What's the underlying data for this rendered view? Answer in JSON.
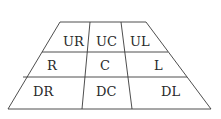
{
  "diagram": {
    "rows": [
      {
        "cells": [
          {
            "label": "UR"
          },
          {
            "label": "UC"
          },
          {
            "label": "UL"
          }
        ]
      },
      {
        "cells": [
          {
            "label": "R"
          },
          {
            "label": "C"
          },
          {
            "label": "L"
          }
        ]
      },
      {
        "cells": [
          {
            "label": "DR"
          },
          {
            "label": "DC"
          },
          {
            "label": "DL"
          }
        ]
      }
    ],
    "colors": {
      "line": "#3a3a3a",
      "text": "#2a2a2a",
      "background": "#ffffff"
    }
  }
}
